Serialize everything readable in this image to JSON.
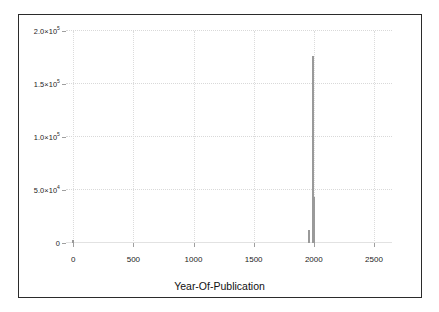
{
  "chart_data": {
    "type": "bar",
    "title": "",
    "subtitle": "",
    "xlabel": "Year-Of-Publication",
    "ylabel": "",
    "xlim": [
      -60,
      2650
    ],
    "ylim": [
      0,
      200000
    ],
    "grid": true,
    "legend": null,
    "legend_position": "none",
    "xticks": [
      0,
      500,
      1000,
      1500,
      2000,
      2500
    ],
    "xtick_labels": [
      "0",
      "500",
      "1000",
      "1500",
      "2000",
      "2500"
    ],
    "yticks": [
      0,
      50000,
      100000,
      150000,
      200000
    ],
    "ytick_labels": [
      "0",
      "5.0×10⁴",
      "1.0×10⁵",
      "1.5×10⁵",
      "2.0×10⁵"
    ],
    "ytick_parts": [
      {
        "mantissa": "0",
        "times": "",
        "base": "",
        "exponent": ""
      },
      {
        "mantissa": "5.0",
        "times": "×",
        "base": "10",
        "exponent": "4"
      },
      {
        "mantissa": "1.0",
        "times": "×",
        "base": "10",
        "exponent": "5"
      },
      {
        "mantissa": "1.5",
        "times": "×",
        "base": "10",
        "exponent": "5"
      },
      {
        "mantissa": "2.0",
        "times": "×",
        "base": "10",
        "exponent": "5"
      }
    ],
    "bar_color": "#9a9a9a",
    "frame_color": "#2b2b2b",
    "grid_color": "#d9d9d9",
    "bars": [
      {
        "x": 0,
        "width": 16,
        "value": 3000
      },
      {
        "x": 1960,
        "width": 14,
        "value": 12000
      },
      {
        "x": 1995,
        "width": 7,
        "value": 176000
      },
      {
        "x": 2003,
        "width": 14,
        "value": 43000
      }
    ]
  }
}
